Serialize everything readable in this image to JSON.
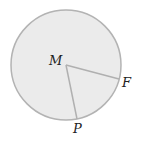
{
  "diagram": {
    "type": "circle-with-radii",
    "center_label": "M",
    "points": [
      {
        "label": "F",
        "role": "point on circle"
      },
      {
        "label": "P",
        "role": "point on circle"
      }
    ],
    "segments": [
      "MF",
      "MP"
    ],
    "colors": {
      "fill": "#ebebeb",
      "stroke": "#b3b3b3",
      "label": "#222222"
    }
  }
}
